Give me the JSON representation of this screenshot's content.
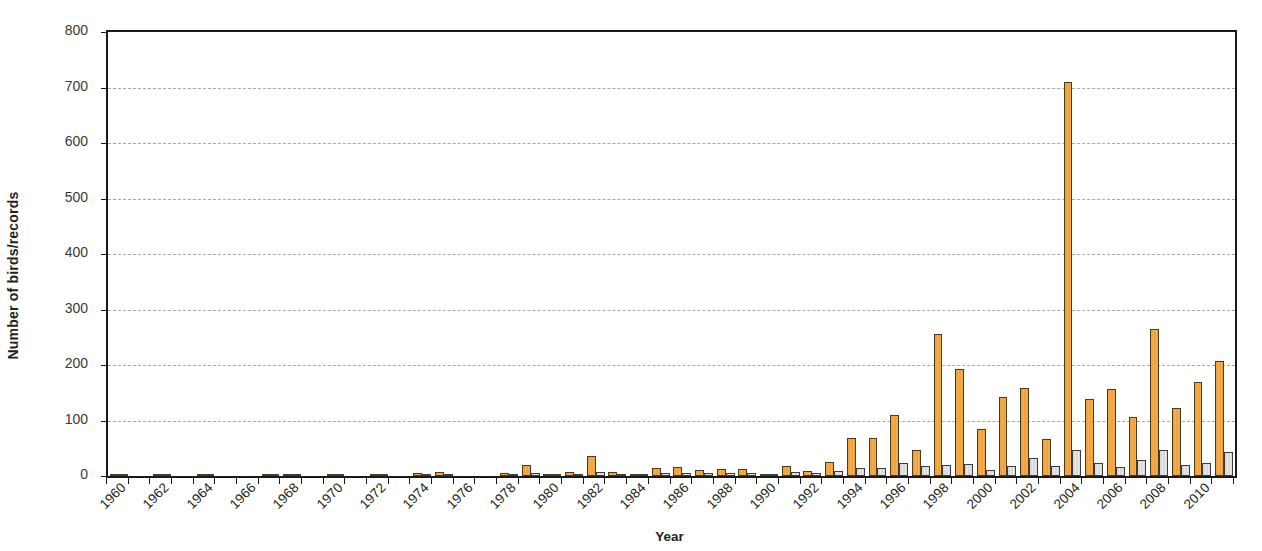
{
  "chart_data": {
    "type": "bar",
    "title": "",
    "xlabel": "Year",
    "ylabel": "Number of birds/records",
    "ylim": [
      0,
      800
    ],
    "ytick_step": 100,
    "yticks": [
      0,
      100,
      200,
      300,
      400,
      500,
      600,
      700,
      800
    ],
    "ytick_labels": [
      "0",
      "100",
      "200",
      "300",
      "400",
      "500",
      "600",
      "700",
      "800"
    ],
    "grid": "horizontal-dashed",
    "legend": "none",
    "xtick_label_rotation": -45,
    "xtick_label_interval": 2,
    "x": [
      1960,
      1961,
      1962,
      1963,
      1964,
      1965,
      1966,
      1967,
      1968,
      1969,
      1970,
      1971,
      1972,
      1973,
      1974,
      1975,
      1976,
      1977,
      1978,
      1979,
      1980,
      1981,
      1982,
      1983,
      1984,
      1985,
      1986,
      1987,
      1988,
      1989,
      1990,
      1991,
      1992,
      1993,
      1994,
      1995,
      1996,
      1997,
      1998,
      1999,
      2000,
      2001,
      2002,
      2003,
      2004,
      2005,
      2006,
      2007,
      2008,
      2009,
      2010,
      2011
    ],
    "xtick_labels": [
      "1960",
      "1962",
      "1964",
      "1966",
      "1968",
      "1970",
      "1972",
      "1974",
      "1976",
      "1978",
      "1980",
      "1982",
      "1984",
      "1986",
      "1988",
      "1990",
      "1992",
      "1994",
      "1996",
      "1998",
      "2000",
      "2002",
      "2004",
      "2006",
      "2008",
      "2010"
    ],
    "series": [
      {
        "name": "Number of birds",
        "color": "#f3a23a",
        "values": [
          2,
          0,
          2,
          0,
          1,
          0,
          0,
          1,
          1,
          0,
          3,
          0,
          4,
          0,
          6,
          7,
          0,
          0,
          5,
          19,
          4,
          7,
          36,
          7,
          2,
          14,
          17,
          10,
          12,
          13,
          1,
          18,
          9,
          26,
          69,
          68,
          110,
          46,
          255,
          192,
          85,
          143,
          158,
          67,
          710,
          138,
          157,
          107,
          265,
          123,
          169,
          208
        ]
      },
      {
        "name": "Number of records",
        "color": "#d9d9d9",
        "values": [
          1,
          0,
          1,
          0,
          1,
          0,
          0,
          1,
          1,
          0,
          2,
          0,
          2,
          0,
          3,
          3,
          0,
          0,
          3,
          6,
          3,
          4,
          8,
          4,
          2,
          6,
          6,
          5,
          6,
          6,
          1,
          7,
          5,
          9,
          15,
          14,
          24,
          18,
          20,
          22,
          11,
          18,
          32,
          18,
          46,
          24,
          17,
          28,
          47,
          20,
          24,
          44
        ]
      }
    ]
  }
}
